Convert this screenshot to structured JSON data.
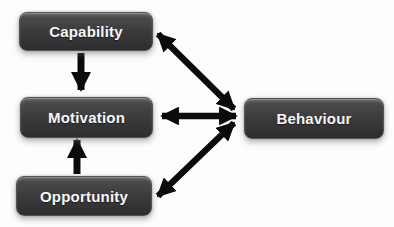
{
  "diagram": {
    "background_color": "#fdfdfd",
    "arrow_color": "#0b0b0b",
    "box_border_color": "#545456",
    "box_fill_top": "#6b6b6d",
    "box_fill_mid": "#3b3b3d",
    "box_fill_bottom": "#2d2d2f",
    "box_text_color": "#f7f7f7",
    "nodes": [
      {
        "id": "capability",
        "label": "Capability"
      },
      {
        "id": "motivation",
        "label": "Motivation"
      },
      {
        "id": "opportunity",
        "label": "Opportunity"
      },
      {
        "id": "behaviour",
        "label": "Behaviour"
      }
    ],
    "edges": [
      {
        "from": "capability",
        "to": "motivation",
        "bidirectional": false
      },
      {
        "from": "opportunity",
        "to": "motivation",
        "bidirectional": false
      },
      {
        "from": "capability",
        "to": "behaviour",
        "bidirectional": true
      },
      {
        "from": "motivation",
        "to": "behaviour",
        "bidirectional": true
      },
      {
        "from": "opportunity",
        "to": "behaviour",
        "bidirectional": true
      }
    ]
  }
}
